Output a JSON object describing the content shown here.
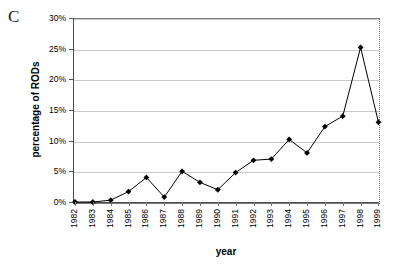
{
  "panel": {
    "label": "C"
  },
  "chart_data": {
    "type": "line",
    "title": "",
    "xlabel": "year",
    "ylabel": "percentage of RODs",
    "categories": [
      "1982",
      "1983",
      "1984",
      "1985",
      "1986",
      "1987",
      "1988",
      "1989",
      "1990",
      "1991",
      "1992",
      "1993",
      "1994",
      "1995",
      "1996",
      "1997",
      "1998",
      "1999"
    ],
    "values": [
      0.0,
      0.0,
      0.3,
      1.7,
      4.0,
      0.8,
      5.0,
      3.2,
      2.0,
      4.8,
      6.8,
      7.0,
      10.2,
      8.0,
      12.3,
      14.0,
      25.2,
      13.0
    ],
    "ylim": [
      0,
      30
    ],
    "ytick_values": [
      0,
      5,
      10,
      15,
      20,
      25,
      30
    ],
    "ytick_labels": [
      "0%",
      "5%",
      "10%",
      "15%",
      "20%",
      "25%",
      "30%"
    ],
    "grid": true,
    "legend": "none",
    "marker": "diamond",
    "line_color": "#000000",
    "marker_color": "#000000",
    "grid_color": "#c9c9c9"
  }
}
